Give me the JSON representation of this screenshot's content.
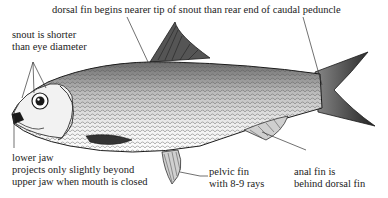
{
  "diagram": {
    "colors": {
      "ink": "#1a1a1a",
      "body_shade": "#9a9a9a",
      "fin_dark": "#333333",
      "text": "#222222",
      "background": "#ffffff"
    },
    "labels": {
      "dorsal": {
        "line1": "dorsal fin begins nearer tip of snout than rear end of caudal peduncle"
      },
      "snout": {
        "line1": "snout is shorter",
        "line2": "than eye diameter"
      },
      "lower_jaw": {
        "line1": "lower jaw",
        "line2": "projects only slightly beyond",
        "line3": "upper jaw when mouth is closed"
      },
      "pelvic": {
        "line1": "pelvic fin",
        "line2": "with 8-9 rays"
      },
      "anal": {
        "line1": "anal fin is",
        "line2": "behind dorsal fin"
      }
    }
  }
}
